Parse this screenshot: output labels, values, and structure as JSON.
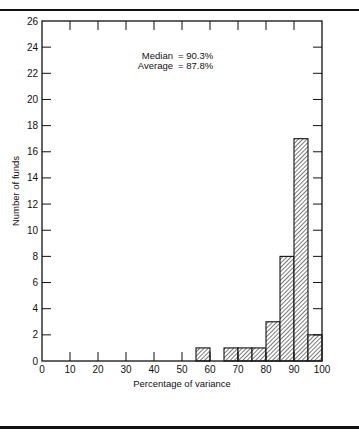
{
  "chart_data": {
    "type": "bar",
    "subtype": "histogram",
    "title": "",
    "xlabel": "Percentage of variance",
    "ylabel": "Number of funds",
    "xlim": [
      0,
      100
    ],
    "ylim": [
      0,
      26
    ],
    "x_ticks": [
      0,
      10,
      20,
      30,
      40,
      50,
      60,
      70,
      80,
      90,
      100
    ],
    "y_ticks": [
      0,
      2,
      4,
      6,
      8,
      10,
      12,
      14,
      16,
      18,
      20,
      22,
      24,
      26
    ],
    "bin_width": 5,
    "bins": [
      {
        "start": 55,
        "end": 60,
        "count": 1
      },
      {
        "start": 65,
        "end": 70,
        "count": 1
      },
      {
        "start": 70,
        "end": 75,
        "count": 1
      },
      {
        "start": 75,
        "end": 80,
        "count": 1
      },
      {
        "start": 80,
        "end": 85,
        "count": 3
      },
      {
        "start": 85,
        "end": 90,
        "count": 8
      },
      {
        "start": 90,
        "end": 95,
        "count": 17
      },
      {
        "start": 95,
        "end": 100,
        "count": 2
      }
    ],
    "categories": [
      "55-60",
      "65-70",
      "70-75",
      "75-80",
      "80-85",
      "85-90",
      "90-95",
      "95-100"
    ],
    "values": [
      1,
      1,
      1,
      1,
      3,
      8,
      17,
      2
    ],
    "annotations": [
      {
        "label": "Median",
        "value": "90.3%"
      },
      {
        "label": "Average",
        "value": "87.8%"
      }
    ],
    "grid": false,
    "bar_fill": "diagonal-hatch",
    "legend": null
  }
}
